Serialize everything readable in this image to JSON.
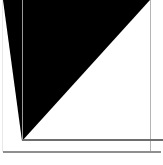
{
  "figure": {
    "canvas": {
      "width_px": 163,
      "height_px": 165,
      "background_color": "#ffffff"
    },
    "shapes": [
      {
        "name": "black-triangle",
        "type": "triangle",
        "fill_color": "#000000",
        "vertices": [
          {
            "x": 3,
            "y": 0
          },
          {
            "x": 150,
            "y": 0
          },
          {
            "x": 22,
            "y": 141
          }
        ],
        "notes": "Flat top edge along the top of the plate; hypotenuse descends from the top-right to the lower-left corner."
      }
    ],
    "rules": [
      {
        "name": "inner-vertical-rule",
        "orientation": "vertical",
        "x": 22,
        "y_start": 0,
        "y_end": 141,
        "color": "#9a9a9a",
        "thickness_px": 1
      },
      {
        "name": "right-vertical-rule",
        "orientation": "vertical",
        "x": 150,
        "y_start": 0,
        "y_end": 153,
        "color": "#b4b4b4",
        "thickness_px": 1
      },
      {
        "name": "inner-horizontal-rule",
        "orientation": "horizontal",
        "y": 139,
        "x_start": 22,
        "x_end": 163,
        "color": "#6e6e6e",
        "thickness_px": 2
      },
      {
        "name": "outer-horizontal-rule",
        "orientation": "horizontal",
        "y": 151,
        "x_start": 3,
        "x_end": 161,
        "color": "#8f8f8f",
        "thickness_px": 2
      },
      {
        "name": "left-margin-rule",
        "orientation": "vertical",
        "x": 2,
        "y_start": 0,
        "y_end": 152,
        "color": "#e8e8e8",
        "thickness_px": 1
      }
    ],
    "palette": {
      "ink": "#000000",
      "paper": "#ffffff",
      "rule_dark": "#6e6e6e",
      "rule_mid": "#9a9a9a",
      "rule_light": "#e8e8e8"
    }
  }
}
